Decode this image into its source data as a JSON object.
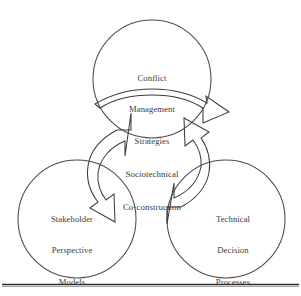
{
  "figure": {
    "type": "cycle-diagram",
    "background_color": "#ffffff",
    "stroke_color": "#4a4a4a",
    "text_color": "#3a3a3a",
    "center": {
      "lines": [
        "Sociotechnical",
        "Co-construction"
      ],
      "text": "Sociotechnical Co-construction"
    },
    "nodes": [
      {
        "id": "top",
        "position": "top",
        "lines": [
          "Conflict",
          "Management",
          "Strategies"
        ],
        "text": "Conflict Management Strategies"
      },
      {
        "id": "bottom-left",
        "position": "bottom-left",
        "lines": [
          "Stakeholder",
          "Perspective",
          "Models"
        ],
        "text": "Stakeholder Perspective Models"
      },
      {
        "id": "bottom-right",
        "position": "bottom-right",
        "lines": [
          "Technical",
          "Decision",
          "Processes"
        ],
        "text": "Technical Decision Processes"
      }
    ],
    "arrows": [
      {
        "id": "arrow-top-to-left",
        "from": "top",
        "to": "bottom-left",
        "direction": "clockwise"
      },
      {
        "id": "arrow-left-to-right",
        "from": "bottom-left",
        "to": "bottom-right",
        "direction": "clockwise"
      },
      {
        "id": "arrow-right-to-top",
        "from": "bottom-right",
        "to": "top",
        "direction": "clockwise"
      }
    ],
    "footer_rule": true
  }
}
